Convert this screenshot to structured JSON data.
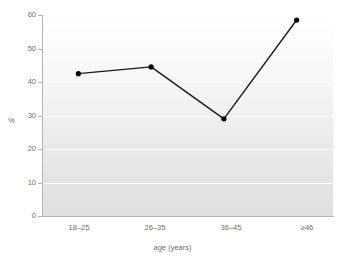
{
  "chart_data": {
    "type": "line",
    "title": "",
    "subtitle": "",
    "xlabel": "age (years)",
    "ylabel": "%",
    "categories": [
      "18–25",
      "26–35",
      "36–45",
      "≥46"
    ],
    "values": [
      42.5,
      44.5,
      29.0,
      58.5
    ],
    "series": [
      {
        "name": "%",
        "values": [
          42.5,
          44.5,
          29.0,
          58.5
        ]
      }
    ],
    "ylim": [
      0,
      60
    ],
    "y_ticks": [
      0,
      10,
      20,
      30,
      40,
      50,
      60
    ],
    "x_ticks": [
      "18–25",
      "26–35",
      "36–45",
      "≥46"
    ],
    "grid": "horizontal",
    "legend": "none",
    "marker": "filled-circle",
    "line_color": "#1a1a1a",
    "marker_color": "#000000",
    "grid_color": "#ffffff",
    "axis_color": "#b4b4b4",
    "tick_label_color": "#6e6e6e",
    "plot_background": "light-gray-vertical-gradient",
    "annotations": []
  },
  "axes": {
    "y_title": "%",
    "x_title": "age (years)",
    "y_tick_labels": [
      "0",
      "10",
      "20",
      "30",
      "40",
      "50",
      "60"
    ],
    "x_tick_labels": [
      "18–25",
      "26–35",
      "36–45",
      "≥46"
    ]
  }
}
